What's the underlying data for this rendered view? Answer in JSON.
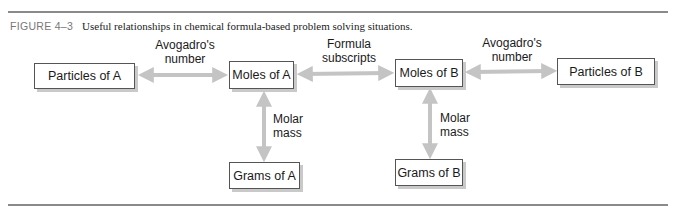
{
  "caption": {
    "figure_label": "FIGURE 4–3",
    "text": "Useful relationships in chemical formula-based problem solving situations."
  },
  "nodes": {
    "particles_a": "Particles of A",
    "moles_a": "Moles of A",
    "moles_b": "Moles of B",
    "particles_b": "Particles of B",
    "grams_a": "Grams of A",
    "grams_b": "Grams of B"
  },
  "edges": {
    "avogadro_a": {
      "line1": "Avogadro's",
      "line2": "number"
    },
    "formula": {
      "line1": "Formula",
      "line2": "subscripts"
    },
    "avogadro_b": {
      "line1": "Avogadro's",
      "line2": "number"
    },
    "molar_a": {
      "line1": "Molar",
      "line2": "mass"
    },
    "molar_b": {
      "line1": "Molar",
      "line2": "mass"
    }
  },
  "colors": {
    "arrow": "#c4c4c4",
    "rule": "#8a8a8a",
    "box_border": "#555555",
    "box_shadow": "#c9c9c9"
  }
}
